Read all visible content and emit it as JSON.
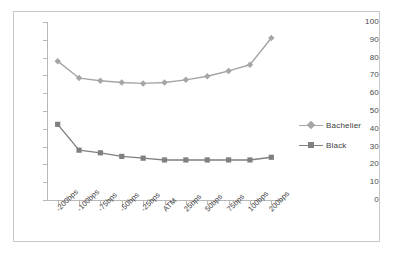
{
  "chart_data": {
    "type": "line",
    "title": "",
    "xlabel": "",
    "ylabel": "",
    "ylim": [
      0,
      100
    ],
    "ytick_step": 10,
    "grid": false,
    "legend_position": "right",
    "categories": [
      "-200bps",
      "-100bps",
      "-75bps",
      "-50bps",
      "-25bps",
      "ATM",
      "25bps",
      "50bps",
      "75bps",
      "100bps",
      "200bps"
    ],
    "ytick_labels": [
      "100",
      "90",
      "80",
      "70",
      "60",
      "50",
      "40",
      "30",
      "20",
      "10",
      "0"
    ],
    "series": [
      {
        "name": "Bachelier",
        "color": "#a6a6a6",
        "marker": "diamond",
        "values": [
          78,
          68.5,
          67,
          66,
          65.5,
          66,
          67.5,
          69.5,
          72.5,
          76,
          91
        ]
      },
      {
        "name": "Black",
        "color": "#808080",
        "marker": "square",
        "values": [
          42.5,
          28,
          26.5,
          24.5,
          23.5,
          22.5,
          22.5,
          22.5,
          22.5,
          22.5,
          24
        ]
      }
    ]
  },
  "legend": {
    "entries": [
      {
        "label": "Bachelier"
      },
      {
        "label": "Black"
      }
    ]
  },
  "colors": {
    "frame_border": "#c9c9c9",
    "axis": "#b8b8b8",
    "tick_text": "#4a4a4a",
    "background": "#ffffff"
  }
}
